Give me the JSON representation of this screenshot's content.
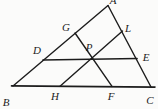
{
  "figure": {
    "background": "#fbfbfa",
    "stroke_color": "#1c1c1c",
    "label_color": "#1c1c1c",
    "default_stroke_width": 1.4,
    "points": {
      "A": [
        108,
        5.5
      ],
      "B": [
        13,
        86
      ],
      "C": [
        151,
        87
      ],
      "D": [
        43,
        60
      ],
      "E": [
        137,
        58.5
      ],
      "G": [
        75,
        33
      ],
      "L": [
        122.5,
        31
      ],
      "H": [
        60,
        86.2
      ],
      "F": [
        112,
        86.4
      ],
      "P": [
        92,
        57.5
      ],
      "Bt": [
        11.5,
        85.9
      ],
      "Ct": [
        155,
        87.1
      ]
    },
    "segments": [
      {
        "name": "AB",
        "from": "A",
        "to": "B",
        "width": 1.4
      },
      {
        "name": "AC",
        "from": "A",
        "to": "C",
        "width": 1.4
      },
      {
        "name": "BC",
        "from": "Bt",
        "to": "Ct",
        "width": 1.6
      },
      {
        "name": "DE",
        "from": "D",
        "to": "E",
        "width": 1.7
      },
      {
        "name": "GF",
        "from": "G",
        "to": "F",
        "width": 1.4
      },
      {
        "name": "LH",
        "from": "L",
        "to": "H",
        "width": 1.4
      }
    ],
    "labels": [
      {
        "text": "A",
        "x": 113,
        "y": 4
      },
      {
        "text": "G",
        "x": 66,
        "y": 31
      },
      {
        "text": "L",
        "x": 128,
        "y": 31.5
      },
      {
        "text": "D",
        "x": 37,
        "y": 53.5
      },
      {
        "text": "P",
        "x": 89,
        "y": 51
      },
      {
        "text": "E",
        "x": 146,
        "y": 61
      },
      {
        "text": "B",
        "x": 6,
        "y": 106
      },
      {
        "text": "H",
        "x": 55,
        "y": 100
      },
      {
        "text": "F",
        "x": 111,
        "y": 100
      },
      {
        "text": "C",
        "x": 150,
        "y": 104
      }
    ]
  }
}
